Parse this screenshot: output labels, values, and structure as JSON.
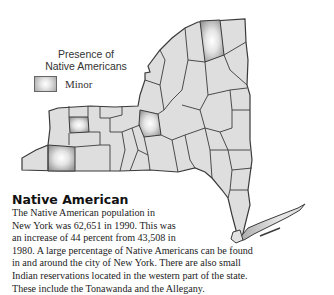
{
  "map": {
    "region": "New York State",
    "legend": {
      "title_line1": "Presence of",
      "title_line2": "Native Americans",
      "items": [
        {
          "label": "Minor",
          "color": "#cfcfcf"
        }
      ]
    },
    "colors": {
      "county_fill": "#dedede",
      "border": "#3a3a3a",
      "highlight_center": "#ffffff",
      "highlight_edge": "#9a9a9a"
    }
  },
  "article": {
    "title": "Native American",
    "lines": [
      "The Native American population in",
      "New York was 62,651 in 1990. This was",
      "an increase of 44 percent from 43,508 in",
      "1980. A large percentage of Native Americans can be found",
      "in and around the city of New York. There are also small",
      "Indian reservations located in the western part of the state.",
      "These include the Tonawanda and the Allegany."
    ]
  }
}
